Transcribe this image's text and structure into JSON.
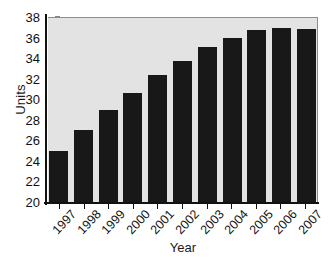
{
  "chart_data": {
    "type": "bar",
    "title": "",
    "xlabel": "Year",
    "ylabel": "Units",
    "categories": [
      "1997",
      "1998",
      "1999",
      "2000",
      "2001",
      "2002",
      "2003",
      "2004",
      "2005",
      "2006",
      "2007"
    ],
    "values": [
      25.0,
      27.0,
      29.0,
      30.6,
      32.4,
      33.7,
      35.1,
      36.0,
      36.7,
      36.9,
      36.8
    ],
    "ylim": [
      20,
      38
    ],
    "yticks": [
      20,
      22,
      24,
      26,
      28,
      30,
      32,
      34,
      36,
      38
    ],
    "ytick_labels": [
      "20",
      "22",
      "24",
      "26",
      "28",
      "30",
      "32",
      "34",
      "36",
      "38"
    ],
    "grid": false,
    "legend": "none",
    "series": [
      {
        "name": "Units",
        "values": [
          25.0,
          27.0,
          29.0,
          30.6,
          32.4,
          33.7,
          35.1,
          36.0,
          36.7,
          36.9,
          36.8
        ]
      }
    ],
    "colors": {
      "bar": "#181818",
      "plot_background": "#e3e3e3",
      "axis": "#111111",
      "figure_background": "#ffffff"
    }
  }
}
